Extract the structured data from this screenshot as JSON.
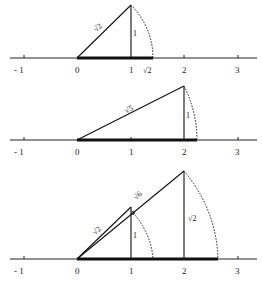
{
  "figure": {
    "type": "number-line-construction",
    "ticks": [
      "- 1",
      "0",
      "1",
      "2",
      "3"
    ],
    "panels": [
      {
        "name": "sqrt2",
        "legs": {
          "horizontal": "1",
          "vertical": "1"
        },
        "hypotenuse_label": "√2",
        "vertical_label": "1",
        "point_label": "√2"
      },
      {
        "name": "sqrt5",
        "legs": {
          "horizontal": "2",
          "vertical": "1"
        },
        "hypotenuse_label": "√5",
        "vertical_label": "1"
      },
      {
        "name": "sqrt6",
        "small_hypotenuse_label": "√2",
        "small_vertical_label": "1",
        "hypotenuse_label": "√6",
        "vertical_label": "√2"
      }
    ]
  }
}
